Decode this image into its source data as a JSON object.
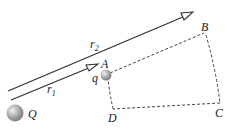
{
  "diagram": {
    "labels": {
      "A": "A",
      "B": "B",
      "C": "C",
      "D": "D",
      "q": "q",
      "Q": "Q",
      "r1": "r",
      "r1_sub": "1",
      "r2": "r",
      "r2_sub": "2"
    },
    "colors": {
      "line": "#333333",
      "dashed": "#444444",
      "sphere": "#9a9a9a"
    }
  }
}
